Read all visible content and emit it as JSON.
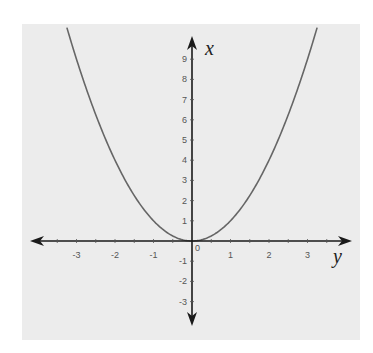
{
  "chart_data": {
    "type": "line",
    "title": "",
    "function": "x = y^2",
    "xlabel": "y",
    "ylabel": "x",
    "horizontal_axis": {
      "label": "y",
      "ticks": [
        -3,
        -2,
        -1,
        1,
        2,
        3
      ],
      "tick_labels": [
        "-3",
        "-2",
        "-1",
        "1",
        "2",
        "3"
      ],
      "minor_ticks_step": 0.5,
      "range": [
        -4,
        4
      ]
    },
    "vertical_axis": {
      "label": "x",
      "ticks": [
        -3,
        -2,
        -1,
        1,
        2,
        3,
        4,
        5,
        6,
        7,
        8,
        9
      ],
      "tick_labels": [
        "-3",
        "-2",
        "-1",
        "1",
        "2",
        "3",
        "4",
        "5",
        "6",
        "7",
        "8",
        "9"
      ],
      "range": [
        -4,
        10
      ]
    },
    "origin_label": "0",
    "series": [
      {
        "name": "parabola",
        "x": [
          -3.25,
          -3,
          -2.5,
          -2,
          -1.5,
          -1,
          -0.5,
          0,
          0.5,
          1,
          1.5,
          2,
          2.5,
          3,
          3.25
        ],
        "y": [
          10.56,
          9,
          6.25,
          4,
          2.25,
          1,
          0.25,
          0,
          0.25,
          1,
          2.25,
          4,
          6.25,
          9,
          10.56
        ],
        "color": "#666666"
      }
    ],
    "grid": false,
    "legend": null,
    "colors": {
      "background": "#ececec",
      "axis": "#1a1a1a",
      "curve": "#666666",
      "tick_label": "#555555"
    }
  }
}
